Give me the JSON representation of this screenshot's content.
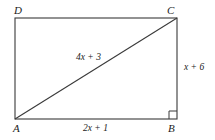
{
  "figure": {
    "name": "rectangle-abcd-with-diagonal",
    "background_color": "#ffffff",
    "stroke_color": "#3a3a3a",
    "text_color": "#1c1c1c",
    "vertices": {
      "top_left": "D",
      "top_right": "C",
      "bottom_left": "A",
      "bottom_right": "B"
    },
    "labels": {
      "diagonal_ac": "4x + 3",
      "side_bc": "x + 6",
      "side_ab": "2x + 1"
    },
    "markers": {
      "right_angle_vertex": "B"
    },
    "geometry": {
      "left": 15,
      "right": 177,
      "top": 18,
      "bottom": 119,
      "right_angle_size": 8
    }
  }
}
